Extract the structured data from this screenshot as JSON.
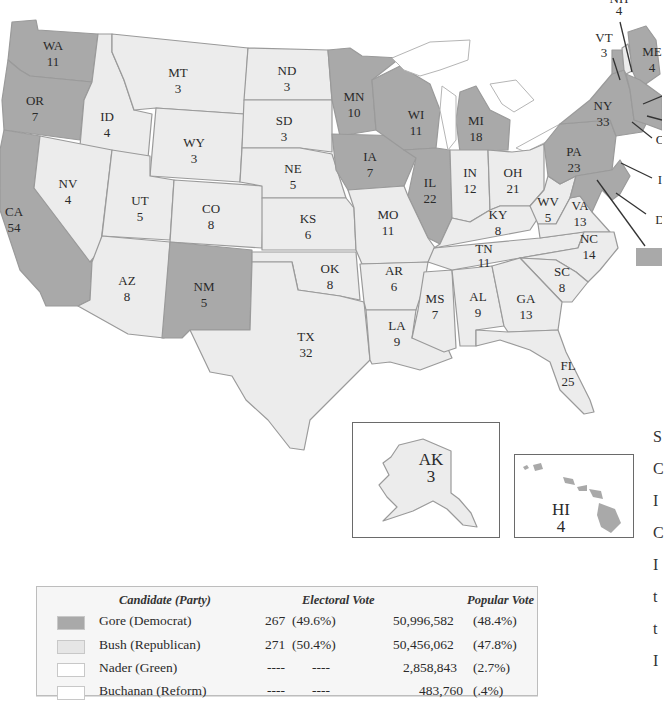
{
  "map": {
    "title": "2000 U.S. Presidential Election Electoral Map",
    "colors": {
      "gore": "#a9a9a9",
      "bush": "#ececec",
      "nader": "#ffffff",
      "buchanan": "#ffffff"
    },
    "states": [
      {
        "abbr": "WA",
        "ev": "11",
        "winner": "gore"
      },
      {
        "abbr": "OR",
        "ev": "7",
        "winner": "gore"
      },
      {
        "abbr": "CA",
        "ev": "54",
        "winner": "gore"
      },
      {
        "abbr": "ID",
        "ev": "4",
        "winner": "bush"
      },
      {
        "abbr": "NV",
        "ev": "4",
        "winner": "bush"
      },
      {
        "abbr": "MT",
        "ev": "3",
        "winner": "bush"
      },
      {
        "abbr": "WY",
        "ev": "3",
        "winner": "bush"
      },
      {
        "abbr": "UT",
        "ev": "5",
        "winner": "bush"
      },
      {
        "abbr": "CO",
        "ev": "8",
        "winner": "bush"
      },
      {
        "abbr": "AZ",
        "ev": "8",
        "winner": "bush"
      },
      {
        "abbr": "NM",
        "ev": "5",
        "winner": "gore"
      },
      {
        "abbr": "ND",
        "ev": "3",
        "winner": "bush"
      },
      {
        "abbr": "SD",
        "ev": "3",
        "winner": "bush"
      },
      {
        "abbr": "NE",
        "ev": "5",
        "winner": "bush"
      },
      {
        "abbr": "KS",
        "ev": "6",
        "winner": "bush"
      },
      {
        "abbr": "OK",
        "ev": "8",
        "winner": "bush"
      },
      {
        "abbr": "TX",
        "ev": "32",
        "winner": "bush"
      },
      {
        "abbr": "MN",
        "ev": "10",
        "winner": "gore"
      },
      {
        "abbr": "IA",
        "ev": "7",
        "winner": "gore"
      },
      {
        "abbr": "MO",
        "ev": "11",
        "winner": "bush"
      },
      {
        "abbr": "AR",
        "ev": "6",
        "winner": "bush"
      },
      {
        "abbr": "LA",
        "ev": "9",
        "winner": "bush"
      },
      {
        "abbr": "WI",
        "ev": "11",
        "winner": "gore"
      },
      {
        "abbr": "IL",
        "ev": "22",
        "winner": "gore"
      },
      {
        "abbr": "MI",
        "ev": "18",
        "winner": "gore"
      },
      {
        "abbr": "IN",
        "ev": "12",
        "winner": "bush"
      },
      {
        "abbr": "OH",
        "ev": "21",
        "winner": "bush"
      },
      {
        "abbr": "KY",
        "ev": "8",
        "winner": "bush"
      },
      {
        "abbr": "TN",
        "ev": "11",
        "winner": "bush"
      },
      {
        "abbr": "MS",
        "ev": "7",
        "winner": "bush"
      },
      {
        "abbr": "AL",
        "ev": "9",
        "winner": "bush"
      },
      {
        "abbr": "GA",
        "ev": "13",
        "winner": "bush"
      },
      {
        "abbr": "FL",
        "ev": "25",
        "winner": "bush"
      },
      {
        "abbr": "SC",
        "ev": "8",
        "winner": "bush"
      },
      {
        "abbr": "NC",
        "ev": "14",
        "winner": "bush"
      },
      {
        "abbr": "VA",
        "ev": "13",
        "winner": "bush"
      },
      {
        "abbr": "WV",
        "ev": "5",
        "winner": "bush"
      },
      {
        "abbr": "PA",
        "ev": "23",
        "winner": "gore"
      },
      {
        "abbr": "NY",
        "ev": "33",
        "winner": "gore"
      },
      {
        "abbr": "VT",
        "ev": "3",
        "winner": "gore"
      },
      {
        "abbr": "NH",
        "ev": "4",
        "winner": "bush"
      },
      {
        "abbr": "ME",
        "ev": "4",
        "winner": "gore"
      },
      {
        "abbr": "AK",
        "ev": "3",
        "winner": "bush"
      },
      {
        "abbr": "HI",
        "ev": "4",
        "winner": "gore"
      }
    ],
    "cut_off_labels": [
      "C",
      "I",
      "D"
    ]
  },
  "legend": {
    "headers": {
      "candidate": "Candidate (Party)",
      "electoral": "Electoral Vote",
      "popular": "Popular Vote"
    },
    "rows": [
      {
        "candidate": "Gore (Democrat)",
        "ev": "267",
        "ev_pct": "(49.6%)",
        "pv": "50,996,582",
        "pv_pct": "(48.4%)",
        "swatch": "#a9a9a9"
      },
      {
        "candidate": "Bush (Republican)",
        "ev": "271",
        "ev_pct": "(50.4%)",
        "pv": "50,456,062",
        "pv_pct": "(47.8%)",
        "swatch": "#e6e6e6"
      },
      {
        "candidate": "Nader (Green)",
        "ev": "----",
        "ev_pct": "----",
        "pv": "2,858,843",
        "pv_pct": "(2.7%)",
        "swatch": "#ffffff"
      },
      {
        "candidate": "Buchanan (Reform)",
        "ev": "----",
        "ev_pct": "----",
        "pv": "483,760",
        "pv_pct": "(.4%)",
        "swatch": "#ffffff"
      }
    ]
  },
  "side_text_fragments": [
    "S",
    "C",
    "I",
    "C",
    "I",
    "t",
    "t",
    "I"
  ]
}
